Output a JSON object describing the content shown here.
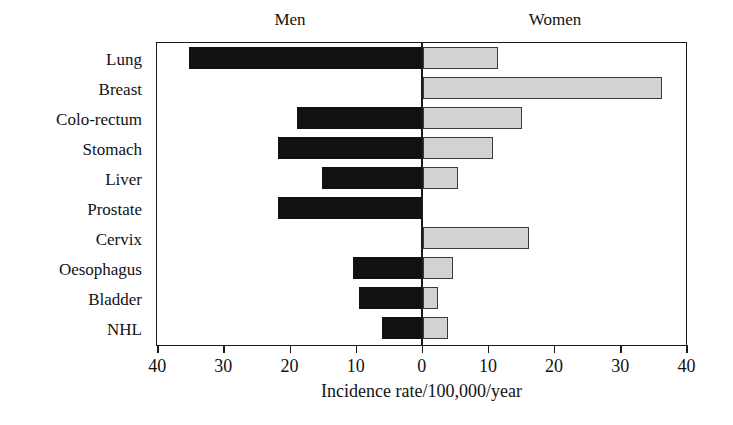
{
  "chart_data": {
    "type": "bar",
    "title": "",
    "subtitle": "",
    "orientation": "horizontal-diverging",
    "xlabel": "Incidence rate/100,000/year",
    "ylabel": "",
    "grid": false,
    "legend_position": "top",
    "axis": {
      "ticks": [
        40,
        30,
        20,
        10,
        0,
        10,
        20,
        30,
        40
      ],
      "tick_labels": [
        "40",
        "30",
        "20",
        "10",
        "0",
        "10",
        "20",
        "30",
        "40"
      ],
      "max": 40,
      "min": 0,
      "center_value": 0,
      "left_side_direction": "Men",
      "right_side_direction": "Women"
    },
    "group_labels": {
      "left": "Men",
      "right": "Women"
    },
    "categories": [
      "Lung",
      "Breast",
      "Colo-rectum",
      "Stomach",
      "Liver",
      "Prostate",
      "Cervix",
      "Oesophagus",
      "Bladder",
      "NHL"
    ],
    "series": [
      {
        "name": "Men",
        "side": "left",
        "color": "#111111",
        "values": [
          35.3,
          0,
          19.0,
          21.9,
          15.2,
          21.9,
          0,
          10.6,
          9.7,
          6.1
        ]
      },
      {
        "name": "Women",
        "side": "right",
        "color": "#d2d2d2",
        "values": [
          11.4,
          36.2,
          15.0,
          10.6,
          5.3,
          0,
          16.1,
          4.6,
          2.3,
          3.8
        ]
      }
    ]
  },
  "colors": {
    "men_fill": "#111111",
    "women_fill": "#d2d2d2",
    "bar_stroke": "#3a3a3a",
    "axis": "#1a1a1a",
    "text": "#121212",
    "background": "#ffffff"
  }
}
